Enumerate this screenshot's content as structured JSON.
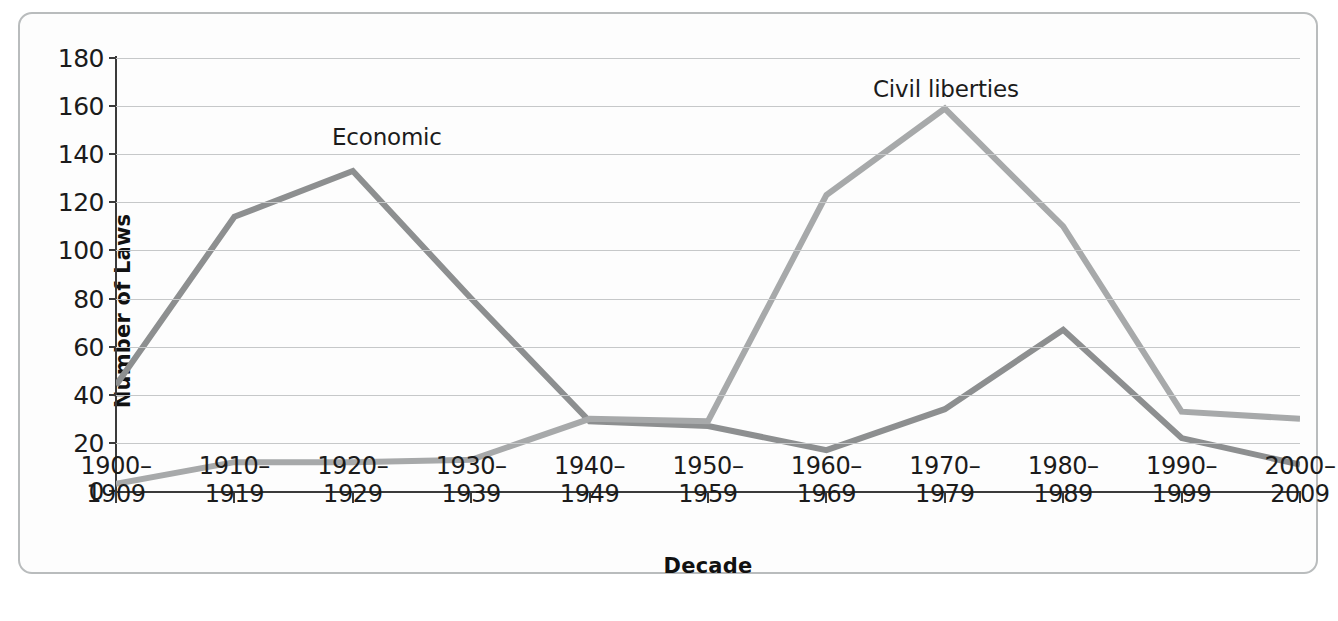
{
  "figure": {
    "y_axis_title": "Number of Laws",
    "x_axis_title": "Decade"
  },
  "annotations": {
    "economic": "Economic",
    "civil_liberties": "Civil liberties"
  },
  "colors": {
    "economic_line": "#8d8f90",
    "civil_liberties_line": "#a7a9aa",
    "gridline": "#c6c8c9",
    "axis": "#3a3a3a",
    "border": "#b9bcbd",
    "background": "#fdfdfd",
    "text": "#1b1b1b"
  },
  "chart_data": {
    "type": "line",
    "title": "",
    "xlabel": "Decade",
    "ylabel": "Number of Laws",
    "ylim": [
      0,
      180
    ],
    "yticks": [
      0,
      20,
      40,
      60,
      80,
      100,
      120,
      140,
      160,
      180
    ],
    "ytick_labels": [
      "0",
      "20",
      "40",
      "60",
      "80",
      "100",
      "120",
      "140",
      "160",
      "180"
    ],
    "grid": true,
    "legend_position": "inline-annotation",
    "categories": [
      "1900–\n1909",
      "1910–\n1919",
      "1920–\n1929",
      "1930–\n1939",
      "1940–\n1949",
      "1950–\n1959",
      "1960–\n1969",
      "1970–\n1979",
      "1980–\n1989",
      "1990–\n1999",
      "2000–\n2009"
    ],
    "category_lines": [
      [
        "1900–",
        "1909"
      ],
      [
        "1910–",
        "1919"
      ],
      [
        "1920–",
        "1929"
      ],
      [
        "1930–",
        "1939"
      ],
      [
        "1940–",
        "1949"
      ],
      [
        "1950–",
        "1959"
      ],
      [
        "1960–",
        "1969"
      ],
      [
        "1970–",
        "1979"
      ],
      [
        "1980–",
        "1989"
      ],
      [
        "1990–",
        "1999"
      ],
      [
        "2000–",
        "2009"
      ]
    ],
    "series": [
      {
        "name": "Economic",
        "color": "#8d8f90",
        "values": [
          44,
          114,
          133,
          80,
          29,
          27,
          17,
          34,
          67,
          22,
          11
        ]
      },
      {
        "name": "Civil liberties",
        "color": "#a7a9aa",
        "values": [
          3,
          12,
          12,
          13,
          30,
          29,
          123,
          159,
          110,
          33,
          30
        ]
      }
    ]
  }
}
